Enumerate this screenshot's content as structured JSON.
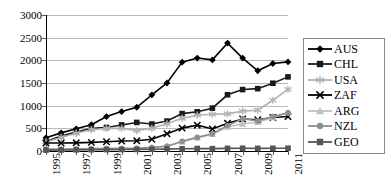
{
  "chart_data": {
    "type": "line",
    "title": "",
    "subtitle": "",
    "xlabel": "",
    "ylabel": "",
    "grid": true,
    "legend_position": "right",
    "xlim": [
      1995,
      2011
    ],
    "ylim": [
      0,
      3000
    ],
    "ytick_labels": [
      "3000",
      "2500",
      "2000",
      "1500",
      "1000",
      "500",
      "0"
    ],
    "ytick_values": [
      3000,
      2500,
      2000,
      1500,
      1000,
      500,
      0
    ],
    "x": [
      1995,
      1996,
      1997,
      1998,
      1999,
      2000,
      2001,
      2002,
      2003,
      2004,
      2005,
      2006,
      2007,
      2008,
      2009,
      2010,
      2011
    ],
    "xtick_labels": [
      "1995",
      "1997",
      "1999",
      "2001",
      "2003",
      "2005",
      "2007",
      "2009",
      "2011"
    ],
    "xtick_values": [
      1995,
      1997,
      1999,
      2001,
      2003,
      2005,
      2007,
      2009,
      2011
    ],
    "series": [
      {
        "name": "AUS",
        "marker": "diamond",
        "color": "#000000",
        "values": [
          290,
          400,
          490,
          580,
          760,
          870,
          965,
          1240,
          1500,
          1960,
          2050,
          2010,
          2380,
          2050,
          1770,
          1930,
          1965
        ]
      },
      {
        "name": "CHL",
        "marker": "square",
        "color": "#1a1a1a",
        "values": [
          210,
          330,
          420,
          500,
          520,
          575,
          630,
          595,
          660,
          825,
          865,
          945,
          1240,
          1355,
          1375,
          1495,
          1635
        ]
      },
      {
        "name": "USA",
        "marker": "star",
        "color": "#b3b3b3",
        "values": [
          200,
          300,
          390,
          470,
          500,
          500,
          450,
          500,
          600,
          720,
          790,
          810,
          820,
          880,
          900,
          1120,
          1360
        ]
      },
      {
        "name": "ZAF",
        "marker": "x",
        "color": "#000000",
        "values": [
          175,
          175,
          180,
          190,
          205,
          220,
          225,
          260,
          380,
          505,
          570,
          485,
          610,
          705,
          690,
          740,
          760
        ]
      },
      {
        "name": "ARG",
        "marker": "triangle",
        "color": "#c0c0c0",
        "values": [
          40,
          45,
          50,
          55,
          60,
          60,
          65,
          80,
          110,
          200,
          295,
          370,
          530,
          600,
          635,
          740,
          845
        ]
      },
      {
        "name": "NZL",
        "marker": "circle",
        "color": "#8f8f8f",
        "values": [
          35,
          40,
          45,
          50,
          55,
          55,
          60,
          75,
          105,
          215,
          300,
          380,
          560,
          710,
          665,
          760,
          845
        ]
      },
      {
        "name": "GEO",
        "marker": "square",
        "color": "#555555",
        "values": [
          20,
          22,
          25,
          28,
          30,
          32,
          35,
          38,
          42,
          48,
          55,
          52,
          58,
          60,
          58,
          60,
          62
        ]
      }
    ]
  },
  "legend": {
    "items": [
      {
        "label": "AUS"
      },
      {
        "label": "CHL"
      },
      {
        "label": "USA"
      },
      {
        "label": "ZAF"
      },
      {
        "label": "ARG"
      },
      {
        "label": "NZL"
      },
      {
        "label": "GEO"
      }
    ]
  }
}
